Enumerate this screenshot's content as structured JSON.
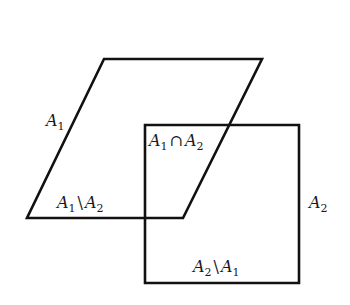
{
  "diagram": {
    "stroke_color": "#111111",
    "background": "#ffffff",
    "shapes": {
      "A1": {
        "type": "parallelogram",
        "points": [
          [
            104,
            59
          ],
          [
            262,
            59
          ],
          [
            183,
            218
          ],
          [
            27,
            218
          ]
        ]
      },
      "A2": {
        "type": "square",
        "points": [
          [
            145,
            125
          ],
          [
            299,
            125
          ],
          [
            299,
            283
          ],
          [
            145,
            283
          ]
        ]
      }
    },
    "labels": {
      "a1": {
        "base": "A",
        "sub": "1"
      },
      "a2": {
        "base": "A",
        "sub": "2"
      },
      "intersection": {
        "left_base": "A",
        "left_sub": "1",
        "op": "∩",
        "right_base": "A",
        "right_sub": "2"
      },
      "a1_minus_a2": {
        "left_base": "A",
        "left_sub": "1",
        "op": "\\",
        "right_base": "A",
        "right_sub": "2"
      },
      "a2_minus_a1": {
        "left_base": "A",
        "left_sub": "2",
        "op": "\\",
        "right_base": "A",
        "right_sub": "1"
      }
    }
  }
}
